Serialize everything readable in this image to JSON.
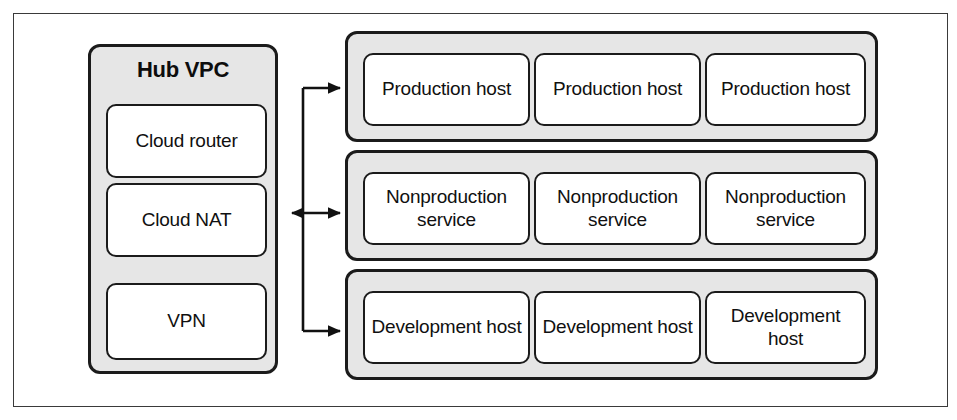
{
  "diagram": {
    "colors": {
      "panel_fill": "#e6e6e6",
      "node_fill": "#ffffff",
      "stroke": "#1b1b1b",
      "frame_stroke": "#3a3a3a",
      "text": "#101010"
    },
    "hub": {
      "title": "Hub VPC",
      "nodes": [
        {
          "label": "Cloud router"
        },
        {
          "label": "Cloud NAT"
        },
        {
          "label": "VPN"
        }
      ]
    },
    "groups": [
      {
        "name": "production",
        "nodes": [
          {
            "label": "Production host"
          },
          {
            "label": "Production host"
          },
          {
            "label": "Production host"
          }
        ]
      },
      {
        "name": "nonproduction",
        "nodes": [
          {
            "label": "Nonproduction service"
          },
          {
            "label": "Nonproduction service"
          },
          {
            "label": "Nonproduction service"
          }
        ]
      },
      {
        "name": "development",
        "nodes": [
          {
            "label": "Development host"
          },
          {
            "label": "Development host"
          },
          {
            "label": "Development host"
          }
        ]
      }
    ],
    "connectors": [
      {
        "name": "hub-to-nonproduction",
        "direction": "bidirectional"
      },
      {
        "name": "hub-to-production",
        "direction": "to-group"
      },
      {
        "name": "hub-to-development",
        "direction": "to-group"
      }
    ]
  }
}
